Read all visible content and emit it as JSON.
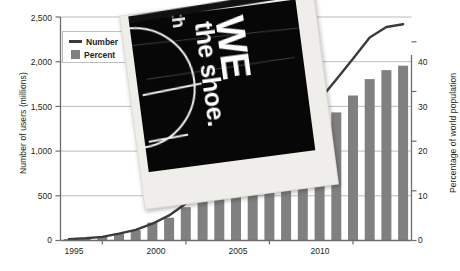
{
  "chart_data": {
    "type": "bar",
    "title": "",
    "subtitle": "",
    "xlabel": "",
    "ylabel": "Number of users (millions)",
    "y2label": "Percentage of world population",
    "grid": true,
    "legend_position": "top-left",
    "x": [
      1993,
      1994,
      1995,
      1996,
      1997,
      1998,
      1999,
      2000,
      2001,
      2002,
      2003,
      2004,
      2005,
      2006,
      2007,
      2008,
      2009,
      2010,
      2011,
      2012,
      2013
    ],
    "xtick_labels": [
      "1995",
      "2000",
      "2005",
      "2010"
    ],
    "xtick_values": [
      1995,
      2000,
      2005,
      2010
    ],
    "ylim": [
      0,
      2500
    ],
    "ytick_labels": [
      "0",
      "500",
      "1,000",
      "1,500",
      "2,000",
      "2,500"
    ],
    "ytick_values": [
      0,
      500,
      1000,
      1500,
      2000,
      2500
    ],
    "y2lim": [
      0,
      45
    ],
    "y2tick_labels": [
      "0",
      "10",
      "20",
      "30",
      "40"
    ],
    "y2tick_values": [
      0,
      10,
      20,
      30,
      40
    ],
    "series": [
      {
        "name": "Number of users (millions)",
        "type": "line",
        "axis": "left",
        "color": "#3b3b3b",
        "values": [
          14,
          25,
          40,
          77,
          120,
          188,
          281,
          414,
          500,
          587,
          719,
          817,
          1018,
          1093,
          1319,
          1574,
          1802,
          2034,
          2272,
          2388,
          2420
        ]
      },
      {
        "name": "Percentage of world population",
        "type": "bar",
        "axis": "right",
        "color": "#808080",
        "values": [
          0.3,
          0.4,
          0.8,
          1.4,
          2.1,
          3.6,
          4.6,
          6.7,
          8.0,
          9.4,
          11.1,
          12.7,
          15.7,
          17.5,
          20.6,
          23.5,
          25.8,
          29.2,
          32.5,
          34.3,
          35.2
        ]
      }
    ],
    "legend": [
      {
        "label": "Number",
        "marker": "line",
        "color": "#3b3b3b"
      },
      {
        "label": "Percent",
        "marker": "square",
        "color": "#808080"
      }
    ]
  },
  "overlay_photo": {
    "text_main": "WE",
    "text_secondary": "the shoe.",
    "text_top": "th",
    "style": "black-and-white tilted photo print"
  }
}
